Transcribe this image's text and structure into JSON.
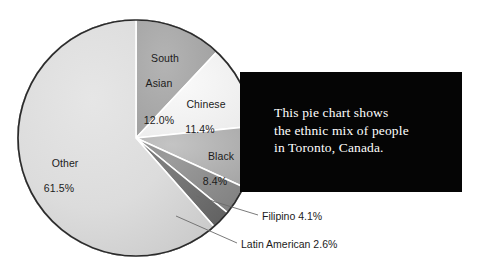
{
  "chart_data": {
    "type": "pie",
    "title": "",
    "categories": [
      "South Asian",
      "Chinese",
      "Black",
      "Filipino",
      "Latin American",
      "Other"
    ],
    "values": [
      12.0,
      11.4,
      8.4,
      4.1,
      2.6,
      61.5
    ],
    "unit": "%",
    "legend_position": "none",
    "grid": false,
    "slices": [
      {
        "label": "South Asian",
        "value": 12.0,
        "value_text": "12.0%",
        "color": "#a9a9a9",
        "label_placement": "inside"
      },
      {
        "label": "Chinese",
        "value": 11.4,
        "value_text": "11.4%",
        "color": "#f2f2f2",
        "label_placement": "inside"
      },
      {
        "label": "Black",
        "value": 8.4,
        "value_text": "8.4%",
        "color": "#b4b4b4",
        "label_placement": "inside"
      },
      {
        "label": "Filipino",
        "value": 4.1,
        "value_text": "4.1%",
        "color": "#8f8f8f",
        "label_placement": "leader"
      },
      {
        "label": "Latin American",
        "value": 2.6,
        "value_text": "2.6%",
        "color": "#6e6e6e",
        "label_placement": "leader"
      },
      {
        "label": "Other",
        "value": 61.5,
        "value_text": "61.5%",
        "color": "#d9d9d9",
        "label_placement": "inside"
      }
    ]
  },
  "labels": {
    "south_asian": {
      "name": "South",
      "name2": "Asian",
      "value": "12.0%"
    },
    "chinese": {
      "name": "Chinese",
      "value": "11.4%"
    },
    "black": {
      "name": "Black",
      "value": "8.4%"
    },
    "other": {
      "name": "Other",
      "value": "61.5%"
    },
    "filipino": {
      "text": "Filipino 4.1%"
    },
    "latin_american": {
      "text": "Latin American 2.6%"
    }
  },
  "note": {
    "text": "This pie chart shows\nthe ethnic mix of people\nin Toronto, Canada.",
    "background": "#050505",
    "color": "#ffffff"
  },
  "colors": {
    "outline": "#2b2b2b",
    "separator": "#ffffff",
    "leader_line": "#6b6b6b",
    "text": "#1b1b1b",
    "page_background": "#ffffff"
  }
}
